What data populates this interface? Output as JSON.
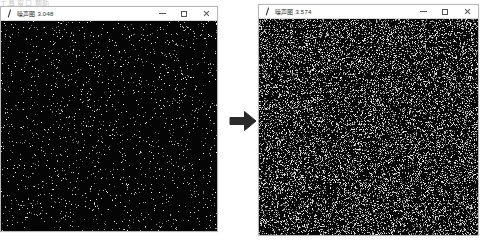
{
  "screen": {
    "background": "#ffffff",
    "clipped_header_text": "工具  窗口  帮助"
  },
  "windows": [
    {
      "id": "before",
      "role": "image-viewer-before",
      "title": "噪声图 3.048",
      "icon": "image-viewer-icon",
      "controls": {
        "minimize_label": "–",
        "maximize_label": "□",
        "close_label": "×"
      },
      "canvas": {
        "label": "sparse-noise-image",
        "background": "#050505",
        "dot_color": "#dcdcdc",
        "density": 0.035,
        "seed": 1337
      },
      "geometry": {
        "left": 0,
        "top": 6,
        "width": 218,
        "height": 226
      }
    },
    {
      "id": "after",
      "role": "image-viewer-after",
      "title": "噪声图 3.574",
      "icon": "image-viewer-icon",
      "controls": {
        "minimize_label": "–",
        "maximize_label": "□",
        "close_label": "×"
      },
      "canvas": {
        "label": "dense-noise-image",
        "background": "#070707",
        "dot_color": "#e8e8e8",
        "density": 0.28,
        "seed": 90210
      },
      "geometry": {
        "left": 258,
        "top": 4,
        "width": 221,
        "height": 232
      }
    }
  ],
  "arrow": {
    "name": "right-arrow",
    "direction": "right",
    "color": "#2a2a2a",
    "geometry": {
      "left": 228,
      "top": 106,
      "width": 30,
      "height": 30
    }
  }
}
